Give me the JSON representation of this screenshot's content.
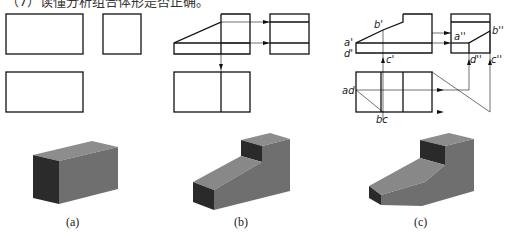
{
  "title": "（7）读懂分析组合体形是否正确。",
  "labels": {
    "b1": "b'",
    "a1": "a'",
    "d1": "d'",
    "c1": "c'",
    "a2": "a''",
    "b2": "b''",
    "d2": "d''",
    "c2": "c''",
    "ad": "ad",
    "bc": "bc"
  },
  "captions": {
    "a": "(a)",
    "b": "(b)",
    "c": "(c)"
  },
  "colors": {
    "line": "#111111",
    "top": "#8a8a8a",
    "front": "#6e6e6e",
    "side": "#2a2a2a"
  }
}
